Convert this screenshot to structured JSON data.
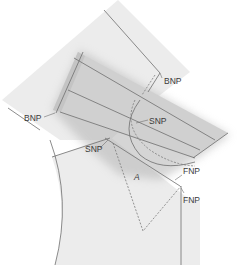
{
  "diagram": {
    "labels": {
      "bnp_back": "BNP",
      "bnp_front": "BNP",
      "snp_upper": "SNP",
      "snp_lower": "SNP",
      "fnp_upper": "FNP",
      "fnp_lower": "FNP",
      "angle": "A"
    },
    "colors": {
      "bodice_fill": "#ececec",
      "collar_band_fill": "#d2d2d2",
      "collar_shadow": "#b8b8b8",
      "line": "#6e6e6e"
    }
  }
}
